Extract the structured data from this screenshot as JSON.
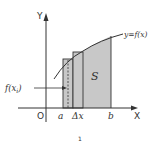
{
  "diagram": {
    "axis_y_label": "Y",
    "axis_x_label": "X",
    "origin_label": "O",
    "curve_label": "y=f(x)",
    "area_label": "S",
    "point_a_label": "a",
    "delta_label": "Δx",
    "point_b_label": "b",
    "height_label": "f(x",
    "height_label_sub": "i",
    "height_label_close": ")",
    "caption": "1"
  },
  "colors": {
    "stroke": "#333333",
    "fill": "#c8c8c8",
    "background": "#ffffff"
  }
}
